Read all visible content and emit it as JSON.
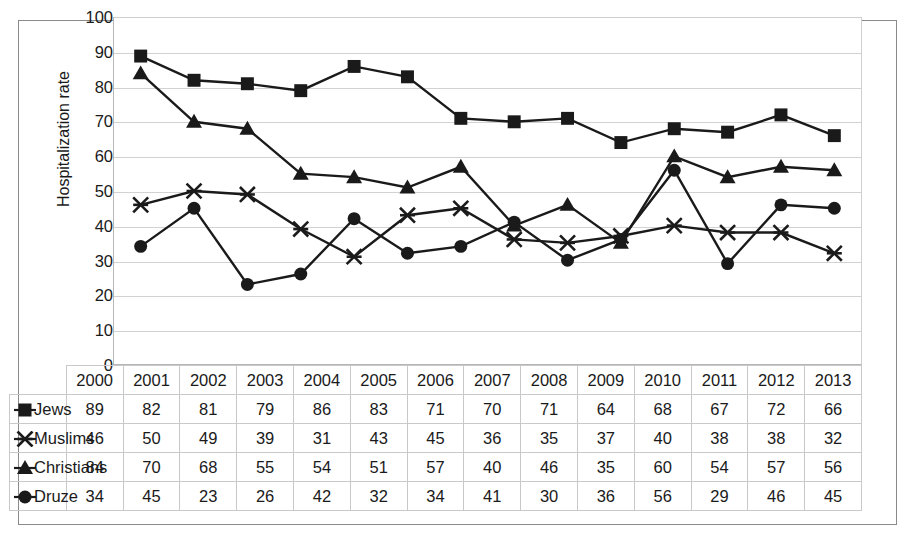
{
  "chart_data": {
    "type": "line",
    "title": "",
    "xlabel": "",
    "ylabel": "Hospitalization rate",
    "ylim": [
      0,
      100
    ],
    "ytick_step": 10,
    "yticks": [
      100,
      90,
      80,
      70,
      60,
      50,
      40,
      30,
      20,
      10,
      0
    ],
    "grid": true,
    "legend_position": "table-left",
    "categories": [
      "2000",
      "2001",
      "2002",
      "2003",
      "2004",
      "2005",
      "2006",
      "2007",
      "2008",
      "2009",
      "2010",
      "2011",
      "2012",
      "2013"
    ],
    "series": [
      {
        "name": "Jews",
        "marker": "square",
        "values": [
          89,
          82,
          81,
          79,
          86,
          83,
          71,
          70,
          71,
          64,
          68,
          67,
          72,
          66
        ]
      },
      {
        "name": "Muslims",
        "marker": "x",
        "values": [
          46,
          50,
          49,
          39,
          31,
          43,
          45,
          36,
          35,
          37,
          40,
          38,
          38,
          32
        ]
      },
      {
        "name": "Christians",
        "marker": "triangle",
        "values": [
          84,
          70,
          68,
          55,
          54,
          51,
          57,
          40,
          46,
          35,
          60,
          54,
          57,
          56
        ]
      },
      {
        "name": "Druze",
        "marker": "circle",
        "values": [
          34,
          45,
          23,
          26,
          42,
          32,
          34,
          41,
          30,
          36,
          56,
          29,
          46,
          45
        ]
      }
    ],
    "colors": {
      "line": "#1a1a1a",
      "marker": "#1a1a1a",
      "gridline": "#d2d2d2",
      "plot_background": "#ffffff",
      "frame": "#8a8a8a",
      "table_border": "#c9c9c9",
      "text": "#1a1a1a"
    }
  }
}
